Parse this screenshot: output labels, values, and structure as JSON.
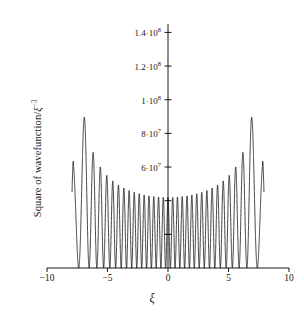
{
  "figure": {
    "width": 304,
    "height": 322,
    "background": "#ffffff",
    "line_color": "#000000"
  },
  "chart_data": {
    "type": "line",
    "title": "",
    "subtitle": "",
    "xlabel": "ξ",
    "ylabel": "Square of wavefunction/ξ⁻³",
    "ylabel_text": "Square of wavefunction/",
    "ylabel_symbol": "ξ",
    "ylabel_exponent": "−3",
    "xlim": [
      -10,
      10
    ],
    "ylim": [
      0,
      145000000
    ],
    "grid": false,
    "legend": null,
    "legend_position": "none",
    "axis_style": "y-spine-at-x0, x-spine-at-y0",
    "xticks": [
      -10,
      -5,
      0,
      5,
      10
    ],
    "xtick_labels": [
      "−10",
      "−5",
      "0",
      "5",
      "10"
    ],
    "yticks": [
      20000000,
      40000000,
      60000000,
      80000000,
      100000000,
      120000000,
      140000000
    ],
    "ytick_labels": [
      "",
      "",
      "6·10⁷",
      "8·10⁷",
      "1·10⁸",
      "1.2·10⁸",
      "1.4·10⁸"
    ],
    "ytick_labels_rich": [
      {
        "value": 20000000,
        "mantissa": "",
        "exponent": "",
        "shown": false
      },
      {
        "value": 40000000,
        "mantissa": "",
        "exponent": "",
        "shown": false
      },
      {
        "value": 60000000,
        "mantissa": "6·10",
        "exponent": "7",
        "shown": true
      },
      {
        "value": 80000000,
        "mantissa": "8·10",
        "exponent": "7",
        "shown": true
      },
      {
        "value": 100000000,
        "mantissa": "1·10",
        "exponent": "8",
        "shown": true
      },
      {
        "value": 120000000,
        "mantissa": "1.2·10",
        "exponent": "8",
        "shown": true
      },
      {
        "value": 140000000,
        "mantissa": "1.4·10",
        "exponent": "8",
        "shown": true
      }
    ],
    "series": [
      {
        "name": "Square of wavefunction",
        "description": "Quantum harmonic oscillator probability density at high quantum number; rapid oscillation under a U-shaped envelope that diverges toward the classical turning points.",
        "quantum_number": 30,
        "turning_point": 7.82,
        "x_start": -7.93,
        "x_end": 7.93,
        "envelope_peak": 122000000,
        "envelope_minimum": 42000000,
        "edge_value_left": 55000000,
        "edge_value_right": 63000000,
        "oscillation_count": 31,
        "node_value": 0
      }
    ]
  }
}
